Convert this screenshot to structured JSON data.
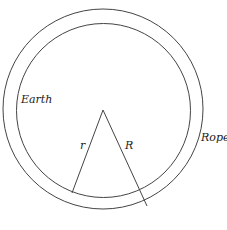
{
  "diagram": {
    "labels": {
      "earth": "Earth",
      "rope": "Rope",
      "small_radius": "r",
      "large_radius": "R"
    },
    "geometry": {
      "center": [
        103,
        110
      ],
      "inner_circle": {
        "cx": 103.5,
        "cy": 110.5,
        "r": 87
      },
      "outer_circle": {
        "cx": 103,
        "cy": 109,
        "r": 100
      },
      "r_line_end": [
        72,
        193
      ],
      "R_line_end": [
        147,
        206
      ]
    },
    "colors": {
      "stroke": "#333333",
      "background": "#ffffff"
    }
  }
}
